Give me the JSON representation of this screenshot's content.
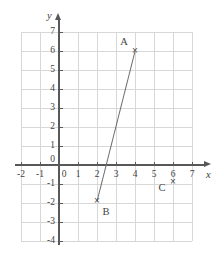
{
  "chart_data": {
    "type": "scatter",
    "title": "",
    "xlabel": "x",
    "ylabel": "y",
    "xlim": [
      -2,
      7
    ],
    "ylim": [
      -4,
      7
    ],
    "grid": true,
    "legend": false,
    "x_ticks": [
      -2,
      -1,
      0,
      1,
      2,
      3,
      4,
      5,
      6,
      7
    ],
    "y_ticks": [
      -4,
      -3,
      -2,
      -1,
      0,
      1,
      2,
      3,
      4,
      5,
      6,
      7
    ],
    "x_tick_labels": [
      "-2",
      "-1",
      "0",
      "1",
      "2",
      "3",
      "4",
      "5",
      "6",
      "7"
    ],
    "y_tick_labels": [
      "-4",
      "-3",
      "-2",
      "-1",
      "0",
      "1",
      "2",
      "3",
      "4",
      "5",
      "6",
      "7"
    ],
    "points": [
      {
        "name": "A",
        "x": 4,
        "y": 6,
        "marker": "×",
        "label": "A",
        "label_dx": -11,
        "label_dy": -9
      },
      {
        "name": "B",
        "x": 2,
        "y": -1.9,
        "marker": "×",
        "label": "B",
        "label_dx": 9,
        "label_dy": 11
      },
      {
        "name": "C",
        "x": 6,
        "y": -0.9,
        "marker": "×",
        "label": "C",
        "label_dx": -11,
        "label_dy": 6
      }
    ],
    "segments": [
      {
        "name": "segment-AB",
        "from": "B",
        "to": "A",
        "x1": 2,
        "y1": -1.9,
        "x2": 4,
        "y2": 6
      }
    ],
    "colors": {
      "grid": "#d7d7d7",
      "axis": "#58585a",
      "line": "#6e6e70",
      "text": "#3f3f41",
      "background": "#ffffff"
    }
  }
}
